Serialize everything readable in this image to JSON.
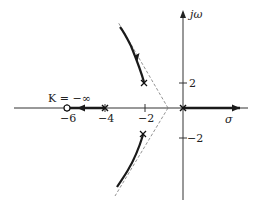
{
  "diagram": {
    "type": "root-locus",
    "axes": {
      "real_label": "σ",
      "imag_label": "jω",
      "x_ticks": [
        {
          "value": -6,
          "label": "−6"
        },
        {
          "value": -4,
          "label": "−4"
        },
        {
          "value": -2,
          "label": "−2"
        }
      ],
      "y_ticks": [
        {
          "value": 2,
          "label": "2"
        },
        {
          "value": -2,
          "label": "−2"
        }
      ]
    },
    "poles": [
      {
        "re": 0,
        "im": 0
      },
      {
        "re": -4,
        "im": 0
      },
      {
        "re": -2,
        "im": 2
      },
      {
        "re": -2,
        "im": -2
      }
    ],
    "zeros": [
      {
        "re": -6,
        "im": 0
      }
    ],
    "annotation": "K = −∞",
    "asymptote_centroid": -0.67,
    "colors": {
      "axis": "#333333",
      "locus": "#1a1a1a",
      "asymptote": "#777777"
    }
  }
}
